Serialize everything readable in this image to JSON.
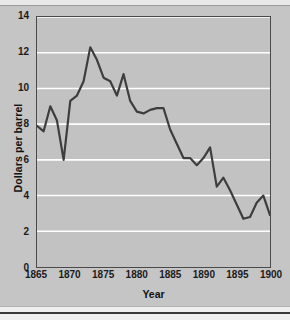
{
  "chart_data": {
    "type": "line",
    "title": "",
    "subtitle": "",
    "xlabel": "Year",
    "ylabel": "Dollars per barrel",
    "xlim": [
      1865,
      1900
    ],
    "ylim": [
      0,
      14
    ],
    "xticks": [
      1865,
      1870,
      1875,
      1880,
      1885,
      1890,
      1895,
      1900
    ],
    "yticks": [
      0,
      2,
      4,
      6,
      8,
      10,
      12,
      14
    ],
    "xtick_labels": [
      "1865",
      "1870",
      "1875",
      "1880",
      "1885",
      "1890",
      "1895",
      "1900"
    ],
    "ytick_labels": [
      "0",
      "2",
      "4",
      "6",
      "8",
      "10",
      "12",
      "14"
    ],
    "grid": "horizontal",
    "grid_color": "#ffffff",
    "legend": "none",
    "plot_background": "#c2c2c2",
    "figure_background": "#c5c5c5",
    "line_color": "#3d3d3d",
    "line_width": 2.2,
    "x": [
      1865,
      1866,
      1867,
      1868,
      1869,
      1870,
      1871,
      1872,
      1873,
      1874,
      1875,
      1876,
      1877,
      1878,
      1879,
      1880,
      1881,
      1882,
      1883,
      1884,
      1885,
      1886,
      1887,
      1888,
      1889,
      1890,
      1891,
      1892,
      1893,
      1894,
      1895,
      1896,
      1897,
      1898,
      1899,
      1900
    ],
    "series": [
      {
        "name": "Price of oil",
        "values": [
          7.9,
          7.6,
          9.0,
          8.2,
          6.0,
          9.3,
          9.6,
          10.4,
          12.3,
          11.6,
          10.6,
          10.4,
          9.6,
          10.8,
          9.3,
          8.7,
          8.6,
          8.8,
          8.9,
          8.9,
          7.7,
          6.9,
          6.1,
          6.1,
          5.7,
          6.1,
          6.7,
          4.5,
          5.0,
          4.3,
          3.5,
          2.7,
          2.8,
          3.6,
          4.0,
          2.9
        ]
      }
    ]
  }
}
